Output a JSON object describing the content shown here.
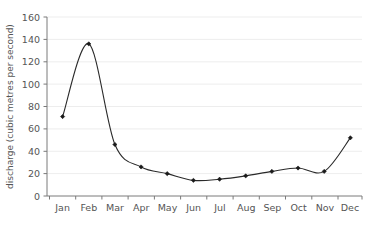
{
  "chart_data": {
    "type": "line",
    "title": "",
    "subtitle": "",
    "xlabel": "",
    "ylabel": "discharge (cubic metres per second)",
    "categories": [
      "Jan",
      "Feb",
      "Mar",
      "Apr",
      "May",
      "Jun",
      "Jul",
      "Aug",
      "Sep",
      "Oct",
      "Nov",
      "Dec"
    ],
    "values": [
      71,
      136,
      46,
      26,
      20,
      14,
      15,
      18,
      22,
      25,
      22,
      52
    ],
    "series": [
      {
        "name": "discharge",
        "values": [
          71,
          136,
          46,
          26,
          20,
          14,
          15,
          18,
          22,
          25,
          22,
          52
        ]
      }
    ],
    "ylim": [
      0,
      160
    ],
    "ytick_values": [
      0,
      20,
      40,
      60,
      80,
      100,
      120,
      140,
      160
    ],
    "ytick_labels": [
      "0",
      "20",
      "40",
      "60",
      "80",
      "100",
      "120",
      "140",
      "160"
    ],
    "xtick_labels": [
      "Jan",
      "Feb",
      "Mar",
      "Apr",
      "May",
      "Jun",
      "Jul",
      "Aug",
      "Sep",
      "Oct",
      "Nov",
      "Dec"
    ],
    "grid": "horizontal",
    "legend": "none",
    "marker": "diamond",
    "line_color": "#2a2a2a",
    "marker_color": "#1a1a1a",
    "grid_color": "#e8e8e8",
    "axis_color": "#7a7a7a",
    "text_color": "#555555",
    "background": "#ffffff"
  },
  "axis": {
    "y_title": "discharge (cubic metres per second)",
    "ticks_y": [
      "0",
      "20",
      "40",
      "60",
      "80",
      "100",
      "120",
      "140",
      "160"
    ],
    "ticks_x": [
      "Jan",
      "Feb",
      "Mar",
      "Apr",
      "May",
      "Jun",
      "Jul",
      "Aug",
      "Sep",
      "Oct",
      "Nov",
      "Dec"
    ]
  }
}
